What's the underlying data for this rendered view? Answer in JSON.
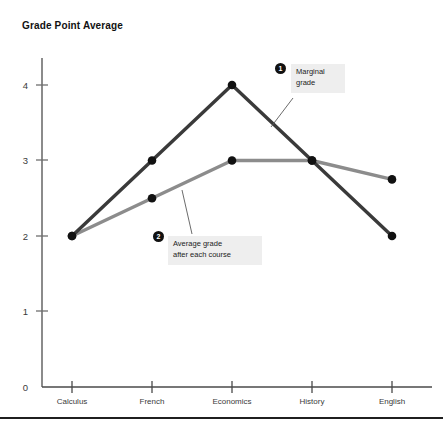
{
  "chart_data": {
    "type": "line",
    "title": "Grade Point Average",
    "xlabel": "",
    "ylabel": "Grade Point Average",
    "categories": [
      "Calculus",
      "French",
      "Economics",
      "History",
      "English"
    ],
    "ylim": [
      0,
      4.4
    ],
    "yticks": [
      0,
      1,
      2,
      3,
      4
    ],
    "ytick_labels": [
      "0",
      "1",
      "2",
      "3",
      "4"
    ],
    "grid": false,
    "legend_position": "none",
    "series": [
      {
        "name": "Marginal grade",
        "color": "#3a3a3a",
        "values": [
          2,
          3,
          4,
          3,
          2
        ]
      },
      {
        "name": "Average grade after each course",
        "color": "#8c8c8c",
        "values": [
          2,
          2.5,
          3,
          3,
          2.75
        ]
      }
    ],
    "annotations": [
      {
        "number": "1",
        "text": "Marginal\ngrade",
        "target_series": "Marginal grade"
      },
      {
        "number": "2",
        "text": "Average grade\nafter each course",
        "target_series": "Average grade after each course"
      }
    ]
  },
  "axis": {
    "y_tick_0": "0",
    "y_tick_1": "1",
    "y_tick_2": "2",
    "y_tick_3": "3",
    "y_tick_4": "4",
    "x_cat_0": "Calculus",
    "x_cat_1": "French",
    "x_cat_2": "Economics",
    "x_cat_3": "History",
    "x_cat_4": "English"
  },
  "callouts": {
    "one": {
      "badge": "1",
      "text": "Marginal\ngrade"
    },
    "two": {
      "badge": "2",
      "text": "Average grade\nafter each course"
    }
  },
  "colors": {
    "marginal_line": "#3a3a3a",
    "average_line": "#8c8c8c",
    "axis": "#6e6e6e",
    "callout_bg": "#eeeeee",
    "badge_bg": "#111111",
    "rule": "#1f1f1f"
  }
}
